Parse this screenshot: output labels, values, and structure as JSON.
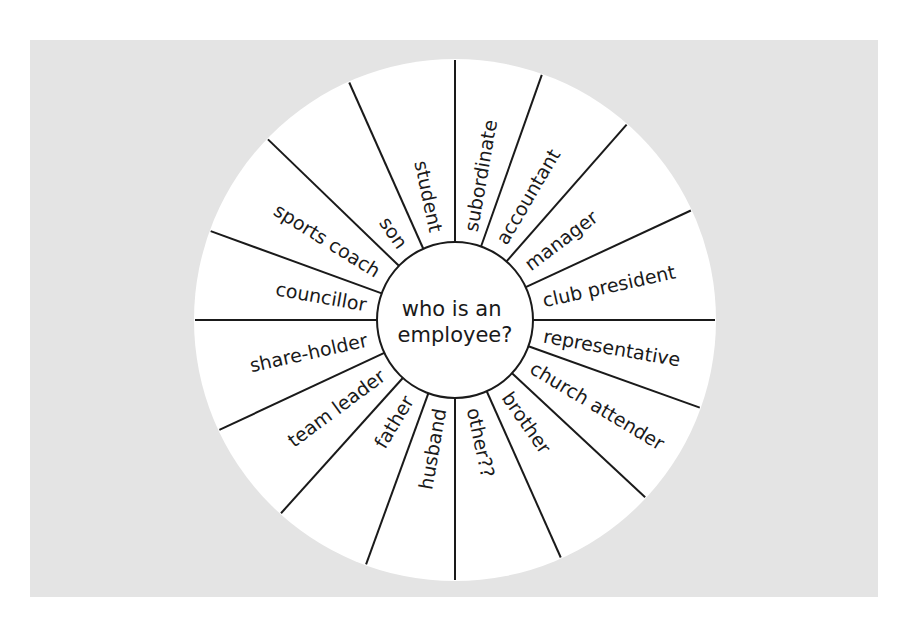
{
  "diagram": {
    "type": "wheel",
    "center_question": [
      "who is an",
      "employee?"
    ],
    "colors": {
      "background": "#e4e4e4",
      "wheel": "#ffffff",
      "lines": "#1a1a1a",
      "text": "#1a1a1a"
    },
    "geometry": {
      "cx": 455,
      "cy": 320,
      "outer_r": 261,
      "hub_r": 78
    },
    "spoke_angles": [
      -160,
      -136,
      -114,
      -90,
      -70.5,
      -48.7,
      -24.9,
      0,
      19.7,
      43,
      66,
      90,
      110,
      132,
      155,
      180
    ],
    "segments": [
      {
        "label": "councillor",
        "angle": -170
      },
      {
        "label": "sports coach",
        "angle": -148
      },
      {
        "label": "son",
        "angle": -125
      },
      {
        "label": "student",
        "angle": -102
      },
      {
        "label": "subordinate",
        "angle": -80
      },
      {
        "label": "accountant",
        "angle": -59.5
      },
      {
        "label": "manager",
        "angle": -37
      },
      {
        "label": "club president",
        "angle": -12.5
      },
      {
        "label": "representative",
        "angle": 10
      },
      {
        "label": "church attender",
        "angle": 31
      },
      {
        "label": "brother",
        "angle": 55
      },
      {
        "label": "other??",
        "angle": 78
      },
      {
        "label": "husband",
        "angle": 100
      },
      {
        "label": "father",
        "angle": 121
      },
      {
        "label": "team leader",
        "angle": 143.5
      },
      {
        "label": "share-holder",
        "angle": 167.5
      }
    ]
  }
}
